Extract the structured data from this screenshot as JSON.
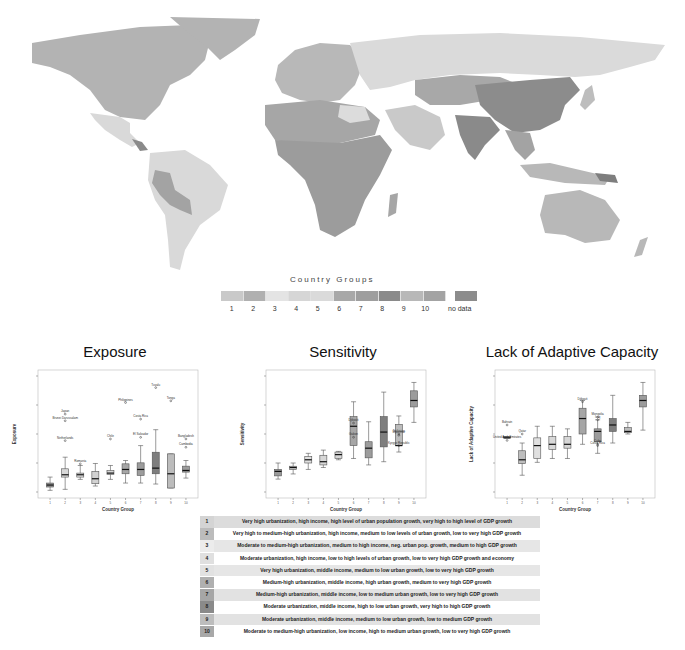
{
  "map": {
    "legend_title": "Country Groups",
    "legend_items": [
      {
        "label": "1",
        "color": "#c9c9c9"
      },
      {
        "label": "2",
        "color": "#b0b0b0"
      },
      {
        "label": "3",
        "color": "#e4e4e4"
      },
      {
        "label": "4",
        "color": "#d6d6d6"
      },
      {
        "label": "5",
        "color": "#dadada"
      },
      {
        "label": "6",
        "color": "#a8a8a8"
      },
      {
        "label": "7",
        "color": "#9e9e9e"
      },
      {
        "label": "8",
        "color": "#8a8a8a"
      },
      {
        "label": "9",
        "color": "#b8b8b8"
      },
      {
        "label": "10",
        "color": "#a3a3a3"
      }
    ],
    "no_data_label": "no data",
    "no_data_color": "#8c8c8c"
  },
  "chart_data": [
    {
      "type": "box",
      "title": "Exposure",
      "xlabel": "Country Group",
      "ylabel": "Exposure",
      "categories": [
        "1",
        "2",
        "3",
        "4",
        "5",
        "6",
        "7",
        "8",
        "9",
        "10"
      ],
      "boxes": [
        {
          "min": 0.05,
          "q1": 0.15,
          "median": 0.21,
          "q3": 0.27,
          "max": 0.45,
          "color": "#9a9a9a"
        },
        {
          "min": 0.08,
          "q1": 0.45,
          "median": 0.52,
          "q3": 0.7,
          "max": 1.05,
          "color": "#d8d8d8"
        },
        {
          "min": 0.38,
          "q1": 0.45,
          "median": 0.52,
          "q3": 0.57,
          "max": 0.8,
          "color": "#e0e0e0"
        },
        {
          "min": 0.18,
          "q1": 0.25,
          "median": 0.4,
          "q3": 0.62,
          "max": 0.86,
          "color": "#d2d2d2"
        },
        {
          "min": 0.38,
          "q1": 0.53,
          "median": 0.57,
          "q3": 0.65,
          "max": 0.8,
          "color": "#d6d6d6"
        },
        {
          "min": 0.27,
          "q1": 0.55,
          "median": 0.68,
          "q3": 0.85,
          "max": 0.95,
          "color": "#a6a6a6"
        },
        {
          "min": 0.27,
          "q1": 0.5,
          "median": 0.68,
          "q3": 0.88,
          "max": 1.4,
          "color": "#9c9c9c"
        },
        {
          "min": 0.24,
          "q1": 0.55,
          "median": 0.72,
          "q3": 1.2,
          "max": 1.88,
          "color": "#7e7e7e"
        },
        {
          "min": 0.12,
          "q1": 0.12,
          "median": 0.55,
          "q3": 1.15,
          "max": 1.15,
          "color": "#bcbcbc"
        },
        {
          "min": 0.42,
          "q1": 0.6,
          "median": 0.65,
          "q3": 0.78,
          "max": 0.95,
          "color": "#9c9c9c"
        }
      ],
      "outliers": [
        {
          "group": 2,
          "value": 1.55,
          "label": "Netherlands"
        },
        {
          "group": 2,
          "value": 2.15,
          "label": "Brunei Darussalam"
        },
        {
          "group": 2,
          "value": 2.35,
          "label": "Japan"
        },
        {
          "group": 3,
          "value": 0.85,
          "label": "Romania"
        },
        {
          "group": 5,
          "value": 1.6,
          "label": "Chile"
        },
        {
          "group": 6,
          "value": 2.7,
          "label": "Philippines"
        },
        {
          "group": 7,
          "value": 2.2,
          "label": "Costa Rica"
        },
        {
          "group": 7,
          "value": 1.65,
          "label": "El Salvador"
        },
        {
          "group": 8,
          "value": 3.15,
          "label": "Tuvalu"
        },
        {
          "group": 9,
          "value": 2.75,
          "label": "Tonga"
        },
        {
          "group": 10,
          "value": 1.6,
          "label": "Bangladesh"
        },
        {
          "group": 10,
          "value": 1.35,
          "label": "Cambodia"
        }
      ],
      "ylim": [
        0,
        3.5
      ]
    },
    {
      "type": "box",
      "title": "Sensitivity",
      "xlabel": "Country Group",
      "ylabel": "Sensitivity",
      "categories": [
        "1",
        "2",
        "3",
        "4",
        "5",
        "6",
        "7",
        "8",
        "9",
        "10"
      ],
      "boxes": [
        {
          "min": 0.2,
          "q1": 0.25,
          "median": 0.32,
          "q3": 0.35,
          "max": 0.45,
          "color": "#9a9a9a"
        },
        {
          "min": 0.28,
          "q1": 0.35,
          "median": 0.38,
          "q3": 0.4,
          "max": 0.45,
          "color": "#c8c8c8"
        },
        {
          "min": 0.35,
          "q1": 0.45,
          "median": 0.5,
          "q3": 0.55,
          "max": 0.6,
          "color": "#e0e0e0"
        },
        {
          "min": 0.38,
          "q1": 0.42,
          "median": 0.47,
          "q3": 0.57,
          "max": 0.65,
          "color": "#d8d8d8"
        },
        {
          "min": 0.5,
          "q1": 0.52,
          "median": 0.58,
          "q3": 0.62,
          "max": 0.63,
          "color": "#d6d6d6"
        },
        {
          "min": 0.52,
          "q1": 0.72,
          "median": 1.02,
          "q3": 1.17,
          "max": 1.4,
          "color": "#a6a6a6"
        },
        {
          "min": 0.42,
          "q1": 0.53,
          "median": 0.68,
          "q3": 0.78,
          "max": 1.09,
          "color": "#9c9c9c"
        },
        {
          "min": 0.47,
          "q1": 0.7,
          "median": 0.93,
          "q3": 1.17,
          "max": 1.55,
          "color": "#7e7e7e"
        },
        {
          "min": 0.62,
          "q1": 0.72,
          "median": 0.72,
          "q3": 1.05,
          "max": 1.18,
          "color": "#bcbcbc"
        },
        {
          "min": 1.08,
          "q1": 1.32,
          "median": 1.42,
          "q3": 1.57,
          "max": 1.7,
          "color": "#9c9c9c"
        }
      ],
      "outliers": [
        {
          "group": 6,
          "value": 1.07,
          "label": "Djibouti"
        },
        {
          "group": 6,
          "value": 0.85,
          "label": "Gabon"
        },
        {
          "group": 9,
          "value": 0.88,
          "label": "Myanmar"
        },
        {
          "group": 9,
          "value": 0.9,
          "label": "Tajikistan"
        },
        {
          "group": 9,
          "value": 0.72,
          "label": "Kyrgyz Republic"
        }
      ],
      "ylim": [
        0,
        1.8
      ]
    },
    {
      "type": "box",
      "title": "Lack of Adaptive Capacity",
      "xlabel": "Country Group",
      "ylabel": "Lack of Adaptive Capacity",
      "categories": [
        "1",
        "2",
        "3",
        "4",
        "5",
        "6",
        "7",
        "8",
        "9",
        "10"
      ],
      "boxes": [
        {
          "min": 0.42,
          "q1": 0.42,
          "median": 0.42,
          "q3": 0.43,
          "max": 0.43,
          "color": "#9a9a9a"
        },
        {
          "min": 0.13,
          "q1": 0.22,
          "median": 0.25,
          "q3": 0.32,
          "max": 0.38,
          "color": "#bdbdbd"
        },
        {
          "min": 0.23,
          "q1": 0.26,
          "median": 0.36,
          "q3": 0.42,
          "max": 0.51,
          "color": "#e0e0e0"
        },
        {
          "min": 0.26,
          "q1": 0.33,
          "median": 0.37,
          "q3": 0.43,
          "max": 0.51,
          "color": "#d8d8d8"
        },
        {
          "min": 0.26,
          "q1": 0.34,
          "median": 0.37,
          "q3": 0.43,
          "max": 0.49,
          "color": "#d6d6d6"
        },
        {
          "min": 0.37,
          "q1": 0.45,
          "median": 0.57,
          "q3": 0.65,
          "max": 0.71,
          "color": "#a6a6a6"
        },
        {
          "min": 0.3,
          "q1": 0.39,
          "median": 0.47,
          "q3": 0.49,
          "max": 0.56,
          "color": "#9c9c9c"
        },
        {
          "min": 0.38,
          "q1": 0.47,
          "median": 0.52,
          "q3": 0.57,
          "max": 0.75,
          "color": "#7e7e7e"
        },
        {
          "min": 0.45,
          "q1": 0.46,
          "median": 0.47,
          "q3": 0.5,
          "max": 0.54,
          "color": "#bcbcbc"
        },
        {
          "min": 0.48,
          "q1": 0.66,
          "median": 0.71,
          "q3": 0.75,
          "max": 0.85,
          "color": "#9c9c9c"
        }
      ],
      "outliers": [
        {
          "group": 1,
          "value": 0.52,
          "label": "Bahrain"
        },
        {
          "group": 1,
          "value": 0.4,
          "label": "United Arab Emirates"
        },
        {
          "group": 2,
          "value": 0.45,
          "label": "Qatar"
        },
        {
          "group": 6,
          "value": 0.7,
          "label": "Djibouti"
        },
        {
          "group": 7,
          "value": 0.58,
          "label": "Mongolia"
        },
        {
          "group": 7,
          "value": 0.56,
          "label": "Iraq"
        },
        {
          "group": 7,
          "value": 0.36,
          "label": "Costa Rica"
        },
        {
          "group": 7,
          "value": 0.37,
          "label": "Cuba"
        }
      ],
      "ylim": [
        0,
        0.9
      ]
    }
  ],
  "group_table": {
    "rows": [
      {
        "num": "1",
        "desc": "Very high urbanization, high income, high level of urban population growth, very high to high level of GDP growth",
        "num_bg": "#d4d4d4",
        "desc_bg": "#dcdcdc"
      },
      {
        "num": "2",
        "desc": "Very high to medium-high urbanization, high income, medium to low levels of urban growth, low to very high GDP growth",
        "num_bg": "#bcbcbc",
        "desc_bg": "#ffffff"
      },
      {
        "num": "3",
        "desc": "Moderate to medium-high urbanization, medium to high income, neg. urban pop. growth, medium to high GDP growth",
        "num_bg": "#ececec",
        "desc_bg": "#e6e6e6"
      },
      {
        "num": "4",
        "desc": "Moderate urbanization, high income, low to high levels of urban growth, low to very high GDP growth and economy",
        "num_bg": "#e0e0e0",
        "desc_bg": "#ffffff"
      },
      {
        "num": "5",
        "desc": "Very high urbanization, middle income, medium to low urban growth, low to very high GDP growth",
        "num_bg": "#e2e2e2",
        "desc_bg": "#e6e6e6"
      },
      {
        "num": "6",
        "desc": "Medium-high urbanization, middle income, high urban growth, medium to very high GDP growth",
        "num_bg": "#b0b0b0",
        "desc_bg": "#ffffff"
      },
      {
        "num": "7",
        "desc": "Medium-high urbanization, middle income, low to medium urban growth, low to very high GDP growth",
        "num_bg": "#a6a6a6",
        "desc_bg": "#e2e2e2"
      },
      {
        "num": "8",
        "desc": "Moderate urbanization, middle income, high to low urban growth, very high to high GDP growth",
        "num_bg": "#8a8a8a",
        "desc_bg": "#ffffff"
      },
      {
        "num": "9",
        "desc": "Moderate urbanization, middle income, medium to low urban growth, low to medium GDP growth",
        "num_bg": "#bdbdbd",
        "desc_bg": "#e2e2e2"
      },
      {
        "num": "10",
        "desc": "Moderate to medium-high urbanization, low income, high to medium urban growth, low to very high GDP growth",
        "num_bg": "#a8a8a8",
        "desc_bg": "#ffffff"
      }
    ]
  }
}
